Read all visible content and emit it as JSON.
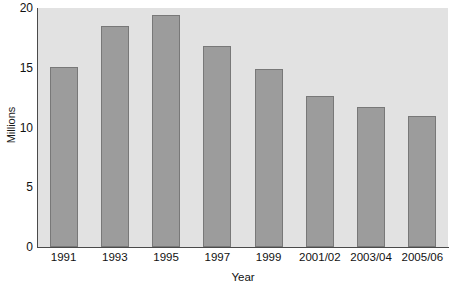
{
  "chart_data": {
    "type": "bar",
    "title": "",
    "subtitle": "",
    "xlabel": "Year",
    "ylabel": "Millions",
    "categories": [
      "1991",
      "1993",
      "1995",
      "1997",
      "1999",
      "2001/02",
      "2003/04",
      "2005/06"
    ],
    "values": [
      15.1,
      18.5,
      19.4,
      16.8,
      14.9,
      12.6,
      11.7,
      11.0
    ],
    "series": [
      {
        "name": "Millions",
        "values": [
          15.1,
          18.5,
          19.4,
          16.8,
          14.9,
          12.6,
          11.7,
          11.0
        ]
      }
    ],
    "ylim": [
      0,
      20
    ],
    "y_ticks": [
      0,
      5,
      10,
      15,
      20
    ],
    "y_tick_labels": [
      "0",
      "5",
      "10",
      "15",
      "20"
    ],
    "grid": false,
    "legend": false,
    "legend_position": "none",
    "annotations": [],
    "colors": {
      "bar_fill": "#9c9c9c",
      "bar_border": "#787878",
      "plot_background": "#e2e2e2",
      "figure_background": "#ffffff",
      "axis_line": "#4a4a4a",
      "text": "#111111"
    }
  }
}
